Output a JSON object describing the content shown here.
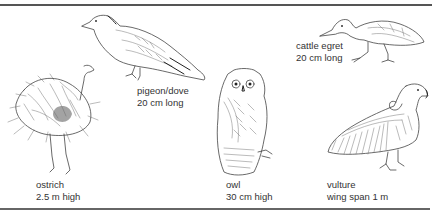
{
  "figure": {
    "birds": [
      {
        "name": "ostrich",
        "size": "2.5 m high"
      },
      {
        "name": "pigeon/dove",
        "size": "20 cm long"
      },
      {
        "name": "owl",
        "size": "30 cm high"
      },
      {
        "name": "cattle egret",
        "size": "20 cm long"
      },
      {
        "name": "vulture",
        "size": "wing span 1 m"
      }
    ]
  }
}
